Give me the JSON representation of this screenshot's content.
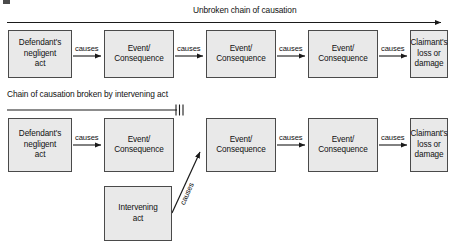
{
  "figure": {
    "title_top": "Unbroken chain of causation",
    "title_bottom": "Chain of causation broken by intervening act",
    "colors": {
      "box_fill": "#e9e9e9",
      "box_border": "#4a4a4a",
      "line": "#1a1a1a",
      "text": "#111111",
      "background": "#ffffff"
    }
  },
  "row_unbroken": {
    "label": "Unbroken chain of causation",
    "nodes": [
      {
        "id": "d-negligent-act",
        "text": "Defendant's negligent act"
      },
      {
        "id": "event-1",
        "text": "Event/ Consequence"
      },
      {
        "id": "event-2",
        "text": "Event/ Consequence"
      },
      {
        "id": "event-3",
        "text": "Event/ Consequence"
      },
      {
        "id": "claimant-loss",
        "text": "Claimant's loss or damage"
      }
    ],
    "edges": [
      {
        "from": "d-negligent-act",
        "to": "event-1",
        "label": "causes"
      },
      {
        "from": "event-1",
        "to": "event-2",
        "label": "causes"
      },
      {
        "from": "event-2",
        "to": "event-3",
        "label": "causes"
      },
      {
        "from": "event-3",
        "to": "claimant-loss",
        "label": "causes"
      }
    ],
    "chain_broken": false
  },
  "row_broken": {
    "label": "Chain of causation broken by intervening act",
    "nodes": [
      {
        "id": "d-negligent-act-2",
        "text": "Defendant's negligent act"
      },
      {
        "id": "event-4",
        "text": "Event/ Consequence"
      },
      {
        "id": "event-5",
        "text": "Event/ Consequence"
      },
      {
        "id": "event-6",
        "text": "Event/ Consequence"
      },
      {
        "id": "claimant-loss-2",
        "text": "Claimant's loss or damage"
      },
      {
        "id": "intervening-act",
        "text": "Intervening act"
      }
    ],
    "edges": [
      {
        "from": "d-negligent-act-2",
        "to": "event-4",
        "label": "causes"
      },
      {
        "from": "intervening-act",
        "to": "event-5",
        "label": "causes"
      },
      {
        "from": "event-5",
        "to": "event-6",
        "label": "causes"
      },
      {
        "from": "event-6",
        "to": "claimant-loss-2",
        "label": "causes"
      }
    ],
    "chain_broken": true,
    "break_marker": "three-hatch-marks"
  },
  "node_text": {
    "defendant_line1": "Defendant's",
    "defendant_line2": "negligent",
    "defendant_line3": "act",
    "event_line1": "Event/",
    "event_line2": "Consequence",
    "claimant_line1": "Claimant's",
    "claimant_line2": "loss or",
    "claimant_line3": "damage",
    "intervening_line1": "Intervening",
    "intervening_line2": "act",
    "causes": "causes"
  }
}
